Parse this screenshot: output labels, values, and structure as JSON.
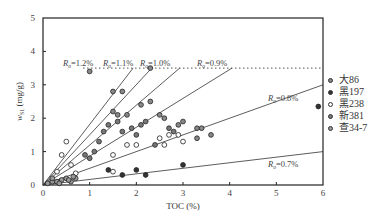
{
  "chart_data": {
    "type": "scatter",
    "title": "",
    "xlabel": "TOC (%)",
    "ylabel": "w_S1 (mg/g)",
    "xlim": [
      0,
      6
    ],
    "ylim": [
      0,
      5
    ],
    "xticks": [
      "0",
      "1",
      "2",
      "3",
      "4",
      "5",
      "6"
    ],
    "yticks": [
      "0",
      "1",
      "2",
      "3",
      "4",
      "5"
    ],
    "grid": false,
    "legend_position": "right",
    "threshold_line": {
      "y": 3.5,
      "style": "dotted"
    },
    "reference_lines": [
      {
        "label": "Ro=1.2%",
        "x_end": 1.93,
        "y_end": 3.5
      },
      {
        "label": "Ro=1.1%",
        "x_end": 2.33,
        "y_end": 3.5
      },
      {
        "label": "Ro=1.0%",
        "x_end": 2.93,
        "y_end": 3.5
      },
      {
        "label": "Ro=0.9%",
        "x_end": 4.05,
        "y_end": 3.5
      },
      {
        "label": "Ro=0.8%",
        "x_end": 6.0,
        "y_end": 3.0
      },
      {
        "label": "Ro=0.7%",
        "x_end": 6.0,
        "y_end": 1.0
      }
    ],
    "series": [
      {
        "name": "大86",
        "marker": "gray-filled-ring",
        "points": [
          [
            1.0,
            3.4
          ],
          [
            1.5,
            2.8
          ],
          [
            1.7,
            2.8
          ],
          [
            2.3,
            3.5
          ],
          [
            2.1,
            2.4
          ],
          [
            2.3,
            2.5
          ],
          [
            1.5,
            2.2
          ],
          [
            1.6,
            2.1
          ],
          [
            1.8,
            2.1
          ],
          [
            2.5,
            2.1
          ],
          [
            2.6,
            2.0
          ],
          [
            2.9,
            1.8
          ],
          [
            3.0,
            1.9
          ],
          [
            3.3,
            1.7
          ],
          [
            3.4,
            1.7
          ],
          [
            3.6,
            1.5
          ],
          [
            3.3,
            1.4
          ]
        ]
      },
      {
        "name": "黑197",
        "marker": "black-filled",
        "points": [
          [
            1.4,
            0.45
          ],
          [
            1.7,
            0.3
          ],
          [
            2.0,
            0.45
          ],
          [
            2.2,
            0.3
          ],
          [
            3.0,
            0.6
          ],
          [
            5.9,
            2.35
          ]
        ]
      },
      {
        "name": "黑238",
        "marker": "open-circle",
        "points": [
          [
            0.5,
            1.3
          ],
          [
            0.4,
            0.9
          ],
          [
            0.3,
            0.4
          ],
          [
            0.6,
            0.6
          ],
          [
            0.7,
            0.35
          ],
          [
            1.5,
            0.4
          ],
          [
            1.5,
            0.9
          ],
          [
            1.8,
            1.2
          ],
          [
            2.0,
            1.2
          ],
          [
            2.5,
            1.4
          ],
          [
            2.7,
            1.5
          ],
          [
            2.9,
            1.5
          ],
          [
            3.0,
            1.3
          ],
          [
            2.6,
            1.2
          ]
        ]
      },
      {
        "name": "新381",
        "marker": "gray-filled-ring",
        "points": [
          [
            0.9,
            0.9
          ],
          [
            1.0,
            0.8
          ],
          [
            1.1,
            1.0
          ],
          [
            1.2,
            1.3
          ],
          [
            1.3,
            1.6
          ],
          [
            1.4,
            1.8
          ],
          [
            1.6,
            1.9
          ],
          [
            1.7,
            1.6
          ],
          [
            1.9,
            1.7
          ],
          [
            2.0,
            1.5
          ],
          [
            2.1,
            1.8
          ],
          [
            2.2,
            1.9
          ],
          [
            2.4,
            1.2
          ],
          [
            2.7,
            1.7
          ],
          [
            2.8,
            1.6
          ]
        ]
      },
      {
        "name": "查34-7",
        "marker": "gray-filled-ring",
        "points": [
          [
            0.1,
            0.05
          ],
          [
            0.2,
            0.1
          ],
          [
            0.3,
            0.1
          ],
          [
            0.4,
            0.15
          ],
          [
            0.5,
            0.2
          ],
          [
            0.6,
            0.1
          ],
          [
            0.7,
            0.2
          ],
          [
            0.2,
            0.2
          ],
          [
            0.35,
            0.05
          ],
          [
            0.55,
            0.15
          ],
          [
            0.65,
            0.25
          ]
        ]
      }
    ]
  },
  "legend": {
    "items": [
      {
        "label": "大86",
        "fill": "#888888"
      },
      {
        "label": "黑197",
        "fill": "#333333"
      },
      {
        "label": "黑238",
        "fill": "#ffffff"
      },
      {
        "label": "新381",
        "fill": "#777777"
      },
      {
        "label": "查34-7",
        "fill": "#999999"
      }
    ]
  },
  "axes": {
    "xlabel": "TOC (%)",
    "ylabel_main": "w",
    "ylabel_sub": "S1",
    "ylabel_unit": " (mg/g)"
  },
  "line_labels": {
    "r12": "=1.2%",
    "r11": "=1.1%",
    "r10": "=1.0%",
    "r09": "=0.9%",
    "r08": "=0.8%",
    "r07": "=0.7%",
    "prefix": "R",
    "sub": "o"
  }
}
